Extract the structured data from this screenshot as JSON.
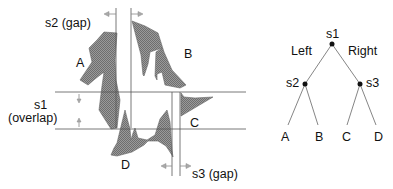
{
  "diagram": {
    "left_panel": {
      "labels": {
        "s2": "s2 (gap)",
        "s1_line1": "s1",
        "s1_line2": "(overlap)",
        "s3": "s3 (gap)"
      },
      "regions": {
        "A": "A",
        "B": "B",
        "C": "C",
        "D": "D"
      }
    },
    "tree": {
      "root": "s1",
      "left_branch_label": "Left",
      "right_branch_label": "Right",
      "internal": [
        "s2",
        "s3"
      ],
      "leaves": [
        "A",
        "B",
        "C",
        "D"
      ]
    },
    "colors": {
      "shape_fill": "#8a8a8a",
      "line": "#555555",
      "text": "#111111"
    }
  }
}
